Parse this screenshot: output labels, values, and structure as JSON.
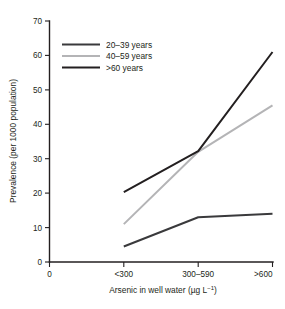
{
  "chart_data": {
    "type": "line",
    "title": "",
    "xlabel": "Arsenic in well water (µg L⁻¹)",
    "ylabel": "Prevalence (per 1000 population)",
    "categories": [
      "<300",
      "300–590",
      ">600"
    ],
    "x_ticks": [
      "0",
      "<300",
      "300–590",
      ">600"
    ],
    "y_ticks": [
      "0",
      "10",
      "20",
      "30",
      "40",
      "50",
      "60",
      "70"
    ],
    "ylim": [
      0,
      70
    ],
    "grid": false,
    "legend_position": "top-left-inside",
    "series": [
      {
        "name": "20–39 years",
        "values": [
          4.5,
          13.0,
          14.0
        ],
        "color": "#3a3a3c"
      },
      {
        "name": "40–59 years",
        "values": [
          11.0,
          32.0,
          45.5
        ],
        "color": "#b4b4b6"
      },
      {
        "name": ">60 years",
        "values": [
          20.3,
          32.2,
          61.0
        ],
        "color": "#231f20"
      }
    ]
  },
  "axis": {
    "x_title_main": "Arsenic in well water (µg L",
    "x_title_sup": "−1",
    "x_title_tail": ")",
    "y_title": "Prevalence (per 1000 population)"
  },
  "colors": {
    "axis": "#231f20",
    "text": "#231f20",
    "background": "#ffffff",
    "series_20_39": "#3a3a3c",
    "series_40_59": "#b4b4b6",
    "series_60_plus": "#231f20"
  }
}
